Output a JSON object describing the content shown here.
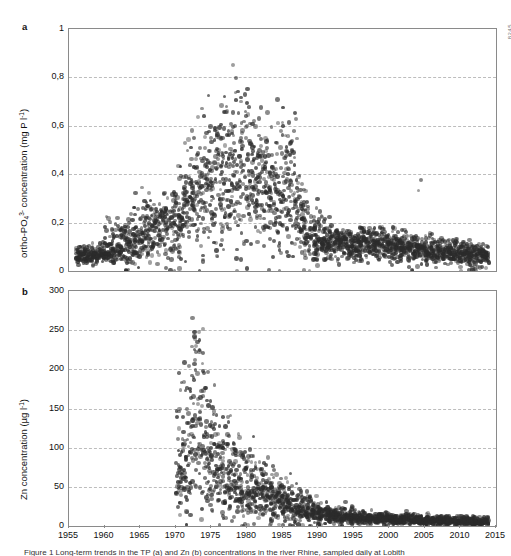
{
  "figure": {
    "side_code": "8245",
    "caption": "Figure 1 Long-term trends in the TP (a) and Zn (b) concentrations in the river Rhine, sampled daily at Lobith",
    "panels": [
      {
        "letter": "a",
        "ylabel_html": "ortho-PO<sub>4</sub><sup>3-</sup> concentration (mg P l<sup>-1</sup>)",
        "ylabel_text": "ortho-PO43- concentration (mg P l-1)",
        "yticks": [
          "0",
          "0,2",
          "0,4",
          "0,6",
          "0,8",
          "1"
        ],
        "ylim": [
          0,
          1
        ]
      },
      {
        "letter": "b",
        "ylabel_html": "Zn concentration (&micro;g l<sup>-1</sup>)",
        "ylabel_text": "Zn concentration (µg l-1)",
        "yticks": [
          "0",
          "50",
          "100",
          "150",
          "200",
          "250",
          "300"
        ],
        "ylim": [
          0,
          300
        ]
      }
    ],
    "xticks": [
      "1955",
      "1960",
      "1965",
      "1970",
      "1975",
      "1980",
      "1985",
      "1990",
      "1995",
      "2000",
      "2005",
      "2010",
      "2015"
    ],
    "xlim": [
      1955,
      2015
    ],
    "marker_color": "#2b2b2b",
    "grid_color": "#bdbdbd",
    "axis_color": "#8a8a8a"
  },
  "chart_data": [
    {
      "type": "scatter",
      "title": "",
      "panel": "a",
      "xlabel": "",
      "ylabel": "ortho-PO43- concentration (mg P l-1)",
      "xlim": [
        1955,
        2015
      ],
      "ylim": [
        0,
        1
      ],
      "yticks": [
        0,
        0.2,
        0.4,
        0.6,
        0.8,
        1
      ],
      "xticks": [
        1955,
        1960,
        1965,
        1970,
        1975,
        1980,
        1985,
        1990,
        1995,
        2000,
        2005,
        2010,
        2015
      ],
      "grid": "horizontal-dashed",
      "legend": "none",
      "series_name": "ortho-phosphate",
      "description": "Daily ortho-phosphate concentrations rise from ~0.07 mg/l in the late 1950s to a broad peak of ~0.35-0.45 mg/l (extremes to 0.89) between 1972 and 1986, then decline sharply after 1986 to a stable ~0.08-0.12 mg/l through 2013.",
      "annual_summary": [
        {
          "year": 1956,
          "median": 0.06,
          "p10": 0.04,
          "p90": 0.09,
          "max": 0.1
        },
        {
          "year": 1957,
          "median": 0.06,
          "p10": 0.04,
          "p90": 0.09,
          "max": 0.11
        },
        {
          "year": 1958,
          "median": 0.065,
          "p10": 0.04,
          "p90": 0.09,
          "max": 0.11
        },
        {
          "year": 1959,
          "median": 0.07,
          "p10": 0.05,
          "p90": 0.1,
          "max": 0.12
        },
        {
          "year": 1960,
          "median": 0.08,
          "p10": 0.05,
          "p90": 0.13,
          "max": 0.26
        },
        {
          "year": 1961,
          "median": 0.09,
          "p10": 0.05,
          "p90": 0.16,
          "max": 0.22
        },
        {
          "year": 1962,
          "median": 0.1,
          "p10": 0.05,
          "p90": 0.17,
          "max": 0.21
        },
        {
          "year": 1963,
          "median": 0.11,
          "p10": 0.04,
          "p90": 0.18,
          "max": 0.21
        },
        {
          "year": 1964,
          "median": 0.145,
          "p10": 0.07,
          "p90": 0.22,
          "max": 0.3
        },
        {
          "year": 1965,
          "median": 0.15,
          "p10": 0.07,
          "p90": 0.23,
          "max": 0.31
        },
        {
          "year": 1966,
          "median": 0.155,
          "p10": 0.07,
          "p90": 0.24,
          "max": 0.3
        },
        {
          "year": 1967,
          "median": 0.175,
          "p10": 0.09,
          "p90": 0.25,
          "max": 0.31
        },
        {
          "year": 1968,
          "median": 0.19,
          "p10": 0.1,
          "p90": 0.26,
          "max": 0.36
        },
        {
          "year": 1969,
          "median": 0.2,
          "p10": 0.1,
          "p90": 0.28,
          "max": 0.34
        },
        {
          "year": 1970,
          "median": 0.22,
          "p10": 0.11,
          "p90": 0.32,
          "max": 0.4
        },
        {
          "year": 1971,
          "median": 0.26,
          "p10": 0.12,
          "p90": 0.38,
          "max": 0.56
        },
        {
          "year": 1972,
          "median": 0.3,
          "p10": 0.15,
          "p90": 0.45,
          "max": 0.62
        },
        {
          "year": 1973,
          "median": 0.34,
          "p10": 0.17,
          "p90": 0.5,
          "max": 0.68
        },
        {
          "year": 1974,
          "median": 0.35,
          "p10": 0.18,
          "p90": 0.52,
          "max": 0.6
        },
        {
          "year": 1975,
          "median": 0.36,
          "p10": 0.19,
          "p90": 0.53,
          "max": 0.6
        },
        {
          "year": 1976,
          "median": 0.4,
          "p10": 0.22,
          "p90": 0.6,
          "max": 0.7
        },
        {
          "year": 1977,
          "median": 0.38,
          "p10": 0.2,
          "p90": 0.58,
          "max": 0.72
        },
        {
          "year": 1978,
          "median": 0.4,
          "p10": 0.2,
          "p90": 0.62,
          "max": 0.89
        },
        {
          "year": 1979,
          "median": 0.4,
          "p10": 0.18,
          "p90": 0.6,
          "max": 0.75
        },
        {
          "year": 1980,
          "median": 0.38,
          "p10": 0.2,
          "p90": 0.55,
          "max": 0.71
        },
        {
          "year": 1981,
          "median": 0.37,
          "p10": 0.2,
          "p90": 0.52,
          "max": 0.62
        },
        {
          "year": 1982,
          "median": 0.35,
          "p10": 0.18,
          "p90": 0.5,
          "max": 0.6
        },
        {
          "year": 1983,
          "median": 0.34,
          "p10": 0.17,
          "p90": 0.5,
          "max": 0.8
        },
        {
          "year": 1984,
          "median": 0.35,
          "p10": 0.18,
          "p90": 0.52,
          "max": 0.73
        },
        {
          "year": 1985,
          "median": 0.34,
          "p10": 0.16,
          "p90": 0.52,
          "max": 0.69
        },
        {
          "year": 1986,
          "median": 0.3,
          "p10": 0.15,
          "p90": 0.48,
          "max": 0.68
        },
        {
          "year": 1987,
          "median": 0.22,
          "p10": 0.12,
          "p90": 0.33,
          "max": 0.44
        },
        {
          "year": 1988,
          "median": 0.16,
          "p10": 0.09,
          "p90": 0.24,
          "max": 0.3
        },
        {
          "year": 1989,
          "median": 0.15,
          "p10": 0.08,
          "p90": 0.22,
          "max": 0.27
        },
        {
          "year": 1990,
          "median": 0.13,
          "p10": 0.07,
          "p90": 0.19,
          "max": 0.24
        },
        {
          "year": 1991,
          "median": 0.12,
          "p10": 0.07,
          "p90": 0.17,
          "max": 0.22
        },
        {
          "year": 1992,
          "median": 0.11,
          "p10": 0.06,
          "p90": 0.15,
          "max": 0.2
        },
        {
          "year": 1993,
          "median": 0.115,
          "p10": 0.07,
          "p90": 0.15,
          "max": 0.19
        },
        {
          "year": 1994,
          "median": 0.11,
          "p10": 0.07,
          "p90": 0.15,
          "max": 0.18
        },
        {
          "year": 1995,
          "median": 0.11,
          "p10": 0.07,
          "p90": 0.15,
          "max": 0.2
        },
        {
          "year": 1996,
          "median": 0.115,
          "p10": 0.07,
          "p90": 0.15,
          "max": 0.19
        },
        {
          "year": 1997,
          "median": 0.11,
          "p10": 0.07,
          "p90": 0.15,
          "max": 0.18
        },
        {
          "year": 1998,
          "median": 0.105,
          "p10": 0.06,
          "p90": 0.14,
          "max": 0.18
        },
        {
          "year": 1999,
          "median": 0.105,
          "p10": 0.06,
          "p90": 0.14,
          "max": 0.2
        },
        {
          "year": 2000,
          "median": 0.1,
          "p10": 0.06,
          "p90": 0.14,
          "max": 0.18
        },
        {
          "year": 2001,
          "median": 0.105,
          "p10": 0.06,
          "p90": 0.14,
          "max": 0.17
        },
        {
          "year": 2002,
          "median": 0.1,
          "p10": 0.06,
          "p90": 0.13,
          "max": 0.16
        },
        {
          "year": 2003,
          "median": 0.095,
          "p10": 0.05,
          "p90": 0.13,
          "max": 0.17
        },
        {
          "year": 2004,
          "median": 0.09,
          "p10": 0.05,
          "p90": 0.12,
          "max": 0.41
        },
        {
          "year": 2005,
          "median": 0.085,
          "p10": 0.05,
          "p90": 0.12,
          "max": 0.15
        },
        {
          "year": 2006,
          "median": 0.085,
          "p10": 0.05,
          "p90": 0.12,
          "max": 0.16
        },
        {
          "year": 2007,
          "median": 0.08,
          "p10": 0.05,
          "p90": 0.11,
          "max": 0.14
        },
        {
          "year": 2008,
          "median": 0.08,
          "p10": 0.05,
          "p90": 0.11,
          "max": 0.14
        },
        {
          "year": 2009,
          "median": 0.075,
          "p10": 0.04,
          "p90": 0.11,
          "max": 0.14
        },
        {
          "year": 2010,
          "median": 0.075,
          "p10": 0.04,
          "p90": 0.1,
          "max": 0.13
        },
        {
          "year": 2011,
          "median": 0.07,
          "p10": 0.04,
          "p90": 0.1,
          "max": 0.13
        },
        {
          "year": 2012,
          "median": 0.07,
          "p10": 0.04,
          "p90": 0.1,
          "max": 0.12
        },
        {
          "year": 2013,
          "median": 0.065,
          "p10": 0.04,
          "p90": 0.09,
          "max": 0.11
        }
      ]
    },
    {
      "type": "scatter",
      "title": "",
      "panel": "b",
      "xlabel": "",
      "ylabel": "Zn concentration (µg l-1)",
      "xlim": [
        1955,
        2015
      ],
      "ylim": [
        0,
        300
      ],
      "yticks": [
        0,
        50,
        100,
        150,
        200,
        250,
        300
      ],
      "xticks": [
        1955,
        1960,
        1965,
        1970,
        1975,
        1980,
        1985,
        1990,
        1995,
        2000,
        2005,
        2010,
        2015
      ],
      "grid": "horizontal-dashed",
      "legend": "none",
      "series_name": "Zn",
      "description": "Zn measurements begin around 1970 at very high values, peaking near 265 µg/l in 1972-1973, then decline steeply through the 1970s and 1980s to below 25 µg/l by 1990 and stabilise near 5-10 µg/l from 1995 to 2013.",
      "annual_summary": [
        {
          "year": 1970,
          "median": 75,
          "p10": 40,
          "p90": 150,
          "max": 200
        },
        {
          "year": 1971,
          "median": 95,
          "p10": 45,
          "p90": 175,
          "max": 215
        },
        {
          "year": 1972,
          "median": 120,
          "p10": 55,
          "p90": 215,
          "max": 265
        },
        {
          "year": 1973,
          "median": 115,
          "p10": 55,
          "p90": 195,
          "max": 255
        },
        {
          "year": 1974,
          "median": 95,
          "p10": 45,
          "p90": 160,
          "max": 200
        },
        {
          "year": 1975,
          "median": 80,
          "p10": 40,
          "p90": 135,
          "max": 170
        },
        {
          "year": 1976,
          "median": 70,
          "p10": 35,
          "p90": 120,
          "max": 155
        },
        {
          "year": 1977,
          "median": 62,
          "p10": 30,
          "p90": 105,
          "max": 140
        },
        {
          "year": 1978,
          "median": 55,
          "p10": 25,
          "p90": 95,
          "max": 125
        },
        {
          "year": 1979,
          "median": 50,
          "p10": 22,
          "p90": 88,
          "max": 118
        },
        {
          "year": 1980,
          "median": 45,
          "p10": 20,
          "p90": 80,
          "max": 105
        },
        {
          "year": 1981,
          "median": 42,
          "p10": 20,
          "p90": 72,
          "max": 98
        },
        {
          "year": 1982,
          "median": 38,
          "p10": 18,
          "p90": 65,
          "max": 90
        },
        {
          "year": 1983,
          "median": 35,
          "p10": 16,
          "p90": 58,
          "max": 82
        },
        {
          "year": 1984,
          "median": 32,
          "p10": 15,
          "p90": 52,
          "max": 75
        },
        {
          "year": 1985,
          "median": 28,
          "p10": 14,
          "p90": 46,
          "max": 68
        },
        {
          "year": 1986,
          "median": 25,
          "p10": 12,
          "p90": 42,
          "max": 62
        },
        {
          "year": 1987,
          "median": 22,
          "p10": 11,
          "p90": 36,
          "max": 55
        },
        {
          "year": 1988,
          "median": 20,
          "p10": 10,
          "p90": 32,
          "max": 48
        },
        {
          "year": 1989,
          "median": 18,
          "p10": 9,
          "p90": 28,
          "max": 42
        },
        {
          "year": 1990,
          "median": 16,
          "p10": 8,
          "p90": 25,
          "max": 38
        },
        {
          "year": 1991,
          "median": 14,
          "p10": 7,
          "p90": 22,
          "max": 34
        },
        {
          "year": 1992,
          "median": 13,
          "p10": 7,
          "p90": 20,
          "max": 30
        },
        {
          "year": 1993,
          "median": 12,
          "p10": 6,
          "p90": 18,
          "max": 28
        },
        {
          "year": 1994,
          "median": 11,
          "p10": 6,
          "p90": 17,
          "max": 25
        },
        {
          "year": 1995,
          "median": 10,
          "p10": 5,
          "p90": 16,
          "max": 24
        },
        {
          "year": 1996,
          "median": 10,
          "p10": 5,
          "p90": 15,
          "max": 22
        },
        {
          "year": 1997,
          "median": 9,
          "p10": 5,
          "p90": 14,
          "max": 21
        },
        {
          "year": 1998,
          "median": 9,
          "p10": 5,
          "p90": 14,
          "max": 20
        },
        {
          "year": 1999,
          "median": 9,
          "p10": 4,
          "p90": 13,
          "max": 19
        },
        {
          "year": 2000,
          "median": 8,
          "p10": 4,
          "p90": 13,
          "max": 20
        },
        {
          "year": 2001,
          "median": 8,
          "p10": 4,
          "p90": 12,
          "max": 18
        },
        {
          "year": 2002,
          "median": 8,
          "p10": 4,
          "p90": 12,
          "max": 17
        },
        {
          "year": 2003,
          "median": 7,
          "p10": 4,
          "p90": 11,
          "max": 16
        },
        {
          "year": 2004,
          "median": 7,
          "p10": 4,
          "p90": 11,
          "max": 16
        },
        {
          "year": 2005,
          "median": 7,
          "p10": 3,
          "p90": 11,
          "max": 18
        },
        {
          "year": 2006,
          "median": 7,
          "p10": 3,
          "p90": 10,
          "max": 15
        },
        {
          "year": 2007,
          "median": 6,
          "p10": 3,
          "p90": 10,
          "max": 15
        },
        {
          "year": 2008,
          "median": 6,
          "p10": 3,
          "p90": 10,
          "max": 14
        },
        {
          "year": 2009,
          "median": 6,
          "p10": 3,
          "p90": 9,
          "max": 14
        },
        {
          "year": 2010,
          "median": 6,
          "p10": 3,
          "p90": 9,
          "max": 13
        },
        {
          "year": 2011,
          "median": 5,
          "p10": 3,
          "p90": 9,
          "max": 13
        },
        {
          "year": 2012,
          "median": 5,
          "p10": 3,
          "p90": 8,
          "max": 12
        },
        {
          "year": 2013,
          "median": 5,
          "p10": 3,
          "p90": 8,
          "max": 12
        }
      ]
    }
  ]
}
